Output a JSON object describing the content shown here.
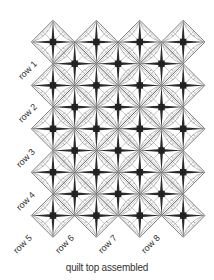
{
  "diagram": {
    "caption": "quilt top assembled",
    "row_labels": [
      "row 1",
      "row 2",
      "row 3",
      "row 4",
      "row 5",
      "row 6",
      "row 7",
      "row 8"
    ],
    "colors": {
      "outline": "#555555",
      "ray": "#2a2a2a",
      "center": "#222222",
      "arc": "#9a9a9a",
      "label": "#333333"
    },
    "grid": {
      "primary_block_columns": 4,
      "primary_block_rows": 5,
      "secondary_block_columns": 3,
      "secondary_block_rows": 4
    }
  }
}
